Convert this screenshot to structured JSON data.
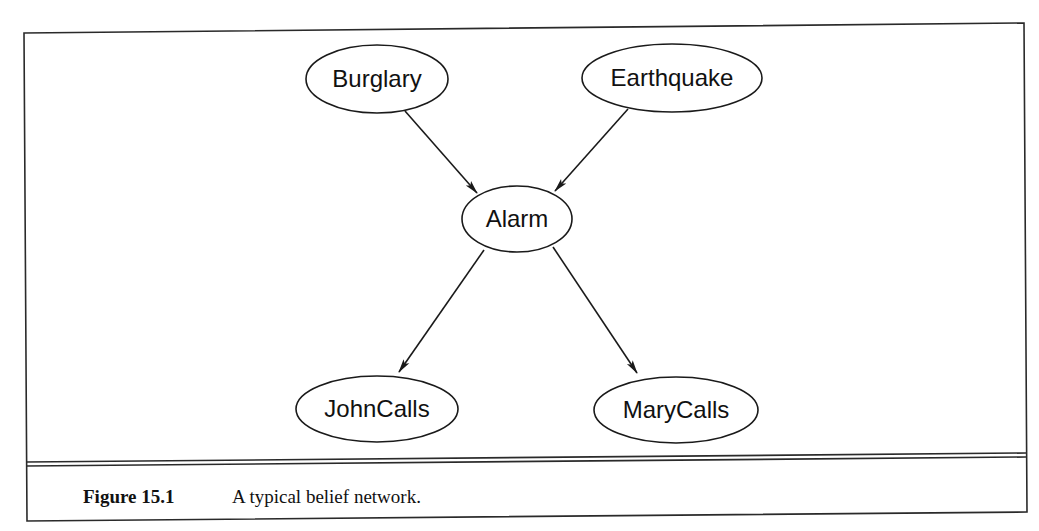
{
  "figure": {
    "number_label": "Figure 15.1",
    "caption": "A typical belief network.",
    "colors": {
      "background": "#ffffff",
      "ink": "#1a1a1a"
    }
  },
  "diagram": {
    "type": "bayesian-belief-network",
    "nodes": [
      {
        "id": "burglary",
        "label": "Burglary",
        "cx": 377,
        "cy": 79,
        "rx": 71,
        "ry": 34
      },
      {
        "id": "earthquake",
        "label": "Earthquake",
        "cx": 672,
        "cy": 78,
        "rx": 90,
        "ry": 34
      },
      {
        "id": "alarm",
        "label": "Alarm",
        "cx": 517,
        "cy": 219,
        "rx": 55,
        "ry": 33
      },
      {
        "id": "johncalls",
        "label": "JohnCalls",
        "cx": 377,
        "cy": 409,
        "rx": 81,
        "ry": 33
      },
      {
        "id": "marycalls",
        "label": "MaryCalls",
        "cx": 676,
        "cy": 410,
        "rx": 82,
        "ry": 33
      }
    ],
    "edges": [
      {
        "from": "burglary",
        "to": "alarm",
        "x1": 405,
        "y1": 111,
        "x2": 477,
        "y2": 193
      },
      {
        "from": "earthquake",
        "to": "alarm",
        "x1": 628,
        "y1": 109,
        "x2": 555,
        "y2": 191
      },
      {
        "from": "alarm",
        "to": "johncalls",
        "x1": 484,
        "y1": 250,
        "x2": 399,
        "y2": 372
      },
      {
        "from": "alarm",
        "to": "marycalls",
        "x1": 553,
        "y1": 247,
        "x2": 637,
        "y2": 373
      }
    ]
  }
}
